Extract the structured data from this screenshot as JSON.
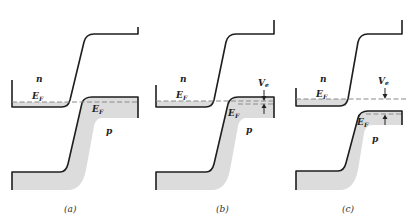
{
  "figure": {
    "panels": [
      {
        "id": "a",
        "caption": "(a)",
        "n_label": "n",
        "p_label": "p",
        "ef_n": "E",
        "ef_n_sub": "F",
        "ef_p": "E",
        "ef_p_sub": "F"
      },
      {
        "id": "b",
        "caption": "(b)",
        "n_label": "n",
        "p_label": "p",
        "ef_n": "E",
        "ef_n_sub": "F",
        "ef_p": "E",
        "ef_p_sub": "F",
        "voltage_label": "V",
        "voltage_sub": "e"
      },
      {
        "id": "c",
        "caption": "(c)",
        "n_label": "n",
        "p_label": "p",
        "ef_n": "E",
        "ef_n_sub": "F",
        "ef_p": "E",
        "ef_p_sub": "F",
        "voltage_label": "V",
        "voltage_sub": "e"
      }
    ],
    "colors": {
      "line": "#1e1e1e",
      "shade": "#dcdcdc",
      "fermi_dash": "#8a8a8a"
    }
  }
}
